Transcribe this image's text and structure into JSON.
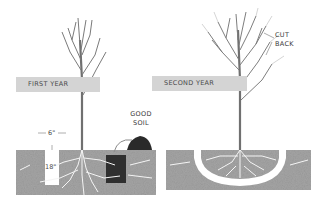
{
  "panels": [
    {
      "title": "FIRST YEAR",
      "annotations": {
        "width_label": "6\"",
        "depth_label": "18\"",
        "soil_label_line1": "GOOD",
        "soil_label_line2": "SOIL"
      }
    },
    {
      "title": "SECOND YEAR",
      "annotations": {
        "prune_label_line1": "CUT",
        "prune_label_line2": "BACK"
      }
    }
  ],
  "colors": {
    "banner": "#d4d4d4",
    "soil": "#9a9a9a",
    "good_soil": "#2e2e2e",
    "trunk": "#6e6e6e",
    "text": "#3a3a3a"
  }
}
